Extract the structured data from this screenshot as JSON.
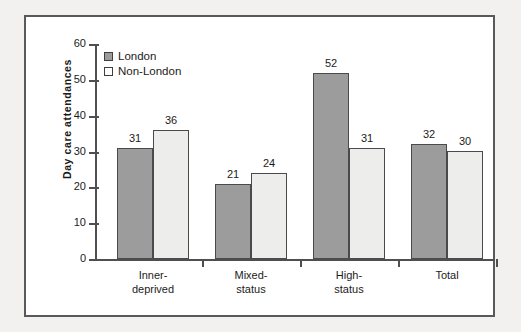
{
  "chart_data": {
    "type": "bar",
    "title": "",
    "xlabel": "",
    "ylabel": "Day care attendances",
    "ylim": [
      0,
      60
    ],
    "ytick_step": 10,
    "yticks": [
      60,
      50,
      40,
      30,
      20,
      10,
      0
    ],
    "grid": false,
    "legend_position": "top-left",
    "categories": [
      "Inner-deprived",
      "Mixed-status",
      "High-status",
      "Total"
    ],
    "category_lines": [
      [
        "Inner-",
        "deprived"
      ],
      [
        "Mixed-",
        "status"
      ],
      [
        "High-",
        "status"
      ],
      [
        "Total",
        ""
      ]
    ],
    "series": [
      {
        "name": "London",
        "color": "#9c9c9c",
        "values": [
          31,
          21,
          52,
          32
        ]
      },
      {
        "name": "Non-London",
        "color": "#ededec",
        "values": [
          36,
          24,
          31,
          30
        ]
      }
    ]
  },
  "legend": {
    "items": [
      {
        "label": "London"
      },
      {
        "label": "Non-London"
      }
    ]
  },
  "colors": {
    "series_london": "#9c9c9c",
    "series_nonlondon": "#ededec",
    "axis": "#4f4f51",
    "frame": "#59595b",
    "text": "#1b1b1b",
    "page_background": "#f2f1f0",
    "plot_background": "#ffffff"
  }
}
